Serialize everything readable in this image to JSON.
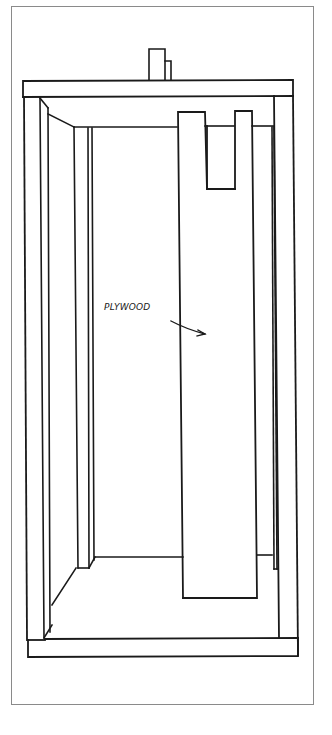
{
  "figure": {
    "type": "line-drawing",
    "colors": {
      "ink": "#1a1a1a",
      "frame": "#8a8a8a",
      "background": "#ffffff"
    }
  },
  "labels": {
    "plywood": "PLYWOOD"
  }
}
